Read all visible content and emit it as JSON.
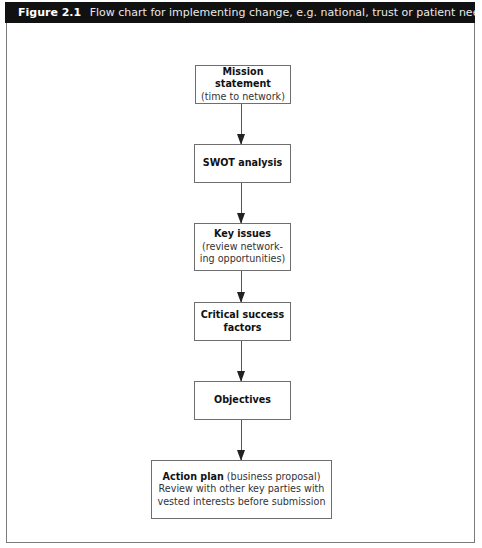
{
  "figure": {
    "label": "Figure 2.1",
    "caption": "Flow chart for implementing change, e.g. national, trust or patient need"
  },
  "flowchart": {
    "nodes": [
      {
        "id": "mission",
        "title": "Mission statement",
        "subtitle": "(time to network)"
      },
      {
        "id": "swot",
        "title": "SWOT analysis",
        "subtitle": ""
      },
      {
        "id": "key-issues",
        "title": "Key issues",
        "subtitle_line1": "(review network-",
        "subtitle_line2": "ing opportunities)"
      },
      {
        "id": "csf",
        "title_line1": "Critical success",
        "title_line2": "factors"
      },
      {
        "id": "objectives",
        "title": "Objectives"
      },
      {
        "id": "action-plan",
        "title": "Action plan",
        "title_suffix": " (business proposal)",
        "line2": "Review with other key parties with",
        "line3": "vested interests before submission"
      }
    ],
    "edges": [
      {
        "from": "mission",
        "to": "swot"
      },
      {
        "from": "swot",
        "to": "key-issues"
      },
      {
        "from": "key-issues",
        "to": "csf"
      },
      {
        "from": "csf",
        "to": "objectives"
      },
      {
        "from": "objectives",
        "to": "action-plan"
      }
    ]
  }
}
